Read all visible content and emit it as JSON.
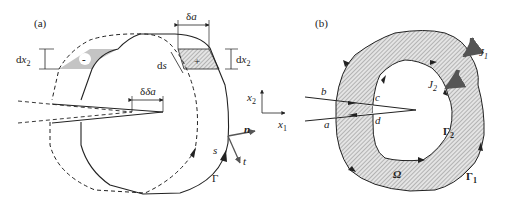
{
  "figure": {
    "panel_a": {
      "label": "(a)",
      "delta_a_top": "δa",
      "delta_a_tip": "δa",
      "dx2_left": "dx",
      "dx2_left_sub": "2",
      "dx2_right": "dx",
      "dx2_right_sub": "2",
      "ds": "ds",
      "minus_sign": "-",
      "plus_sign": "+",
      "contour": "Γ",
      "arc_s": "s",
      "normal_n": "n",
      "tangent_t": "t",
      "axis_x1": "x",
      "axis_x1_sub": "1",
      "axis_x2": "x",
      "axis_x2_sub": "2"
    },
    "panel_b": {
      "label": "(b)",
      "point_a": "a",
      "point_b": "b",
      "point_c": "c",
      "point_d": "d",
      "J1": "J",
      "J1_sub": "1",
      "J2": "J",
      "J2_sub": "2",
      "gamma2": "Γ",
      "gamma2_sub": "2",
      "gamma1": "Γ",
      "gamma1_sub": "1",
      "omega": "Ω"
    },
    "colors": {
      "line": "#222222",
      "hatch_fill": "#cfcfcf",
      "shade_fill": "#bdbdbd",
      "arrow_gray": "#666666"
    }
  }
}
